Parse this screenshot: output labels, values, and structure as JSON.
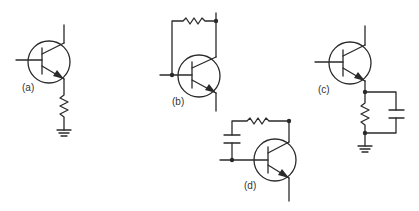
{
  "figure": {
    "type": "schematic",
    "line_color": "#2a2a2a",
    "background": "#ffffff"
  },
  "circuits": [
    {
      "id": "a",
      "label": "(a)",
      "description": "NPN transistor with emitter resistor to ground"
    },
    {
      "id": "b",
      "label": "(b)",
      "description": "NPN transistor with collector-to-base feedback resistor"
    },
    {
      "id": "c",
      "label": "(c)",
      "description": "NPN transistor with emitter resistor bypassed by capacitor to ground"
    },
    {
      "id": "d",
      "label": "(d)",
      "description": "NPN transistor with collector-to-base feedback resistor and capacitor"
    }
  ]
}
